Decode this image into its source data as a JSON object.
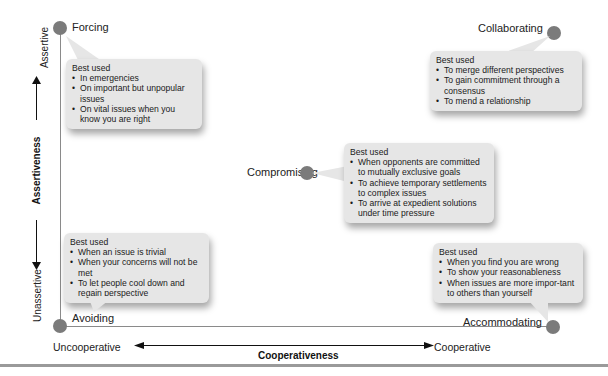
{
  "axes": {
    "y_title": "Assertiveness",
    "y_top": "Assertive",
    "y_bottom": "Unassertive",
    "x_title": "Cooperativeness",
    "x_left": "Uncooperative",
    "x_right": "Cooperative"
  },
  "styles": {
    "forcing": {
      "label": "Forcing",
      "heading": "Best used",
      "items": [
        "In emergencies",
        "On important but unpopular issues",
        "On vital issues when you know you are right"
      ]
    },
    "collaborating": {
      "label": "Collaborating",
      "heading": "Best used",
      "items": [
        "To merge different perspectives",
        "To gain commitment through a consensus",
        "To mend a relationship"
      ]
    },
    "compromising": {
      "label": "Compromising",
      "heading": "Best used",
      "items": [
        "When opponents are committed to mutually exclusive goals",
        "To achieve temporary settlements to complex issues",
        "To arrive at expedient solutions under time pressure"
      ]
    },
    "avoiding": {
      "label": "Avoiding",
      "heading": "Best used",
      "items": [
        "When an issue is trivial",
        "When your concerns will not be met",
        "To let people cool down and regain perspective"
      ]
    },
    "accommodating": {
      "label": "Accommodating",
      "heading": "Best used",
      "items": [
        "When you find you are wrong",
        "To show your reasonableness",
        "When issues are more impor-tant to others than yourself"
      ]
    }
  },
  "colors": {
    "dot": "#7b7b7b",
    "box": "#e6e6e6",
    "axis_line": "#8a8a8a"
  }
}
